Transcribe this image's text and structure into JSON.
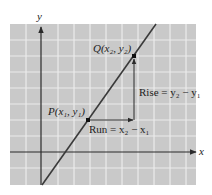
{
  "figure": {
    "type": "slope-diagram",
    "background_color": "#c9c9c9",
    "grid_color": "#ececec",
    "axis_color": "#2a2a2a",
    "line_color": "#3a3a3a"
  },
  "axes": {
    "x_label": "x",
    "y_label": "y"
  },
  "points": {
    "P": {
      "label": "P(x₁, y₁)",
      "name": "P",
      "coords": "x1, y1"
    },
    "Q": {
      "label": "Q(x₂, y₂)",
      "name": "Q",
      "coords": "x2, y2"
    }
  },
  "annotations": {
    "run": "Run = x₂ − x₁",
    "rise": "Rise = y₂ − y₁"
  }
}
